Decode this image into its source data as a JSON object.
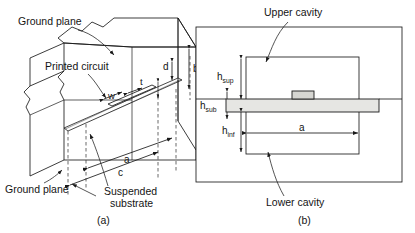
{
  "figure": {
    "title_a_caption": "(a)",
    "title_b_caption": "(b)"
  },
  "panel_a": {
    "caption": "(a)",
    "labels": {
      "ground_plane_top": "Ground plane",
      "ground_plane_bottom": "Ground plane",
      "printed_circuit": "Printed circuit",
      "suspended_substrate_line1": "Suspended",
      "suspended_substrate_line2": "substrate"
    },
    "dimensions": {
      "b": "b",
      "d": "d",
      "a": "a",
      "c": "c",
      "w": "w",
      "t": "t"
    }
  },
  "panel_b": {
    "caption": "(b)",
    "labels": {
      "upper_cavity": "Upper cavity",
      "lower_cavity": "Lower cavity"
    },
    "dimensions": {
      "h_sup_base": "h",
      "h_sup_sub": "sup",
      "h_sub_base": "h",
      "h_sub_sub": "sub",
      "h_inf_base": "h",
      "h_inf_sub": "inf",
      "a": "a"
    }
  },
  "colors": {
    "line": "#1a1a1a",
    "substrate_fill": "#e6e6e3",
    "conductor_fill": "#d6d6d2",
    "background": "#ffffff"
  }
}
